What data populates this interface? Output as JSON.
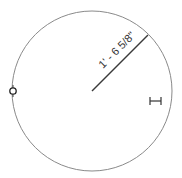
{
  "drawing": {
    "shape": "circle",
    "center": {
      "x": 92,
      "y": 91
    },
    "radius": 80,
    "stroke_color": "#8a8a8a",
    "dimension": {
      "label": "1' - 6 5/8\"",
      "line_color": "#3a3a3a",
      "start": {
        "x": 92,
        "y": 91
      },
      "end": {
        "x": 148,
        "y": 35
      }
    },
    "grips": [
      {
        "name": "control-point-grip",
        "x": 13,
        "y": 91
      },
      {
        "name": "width-indicator",
        "x": 155,
        "y": 101
      }
    ]
  }
}
